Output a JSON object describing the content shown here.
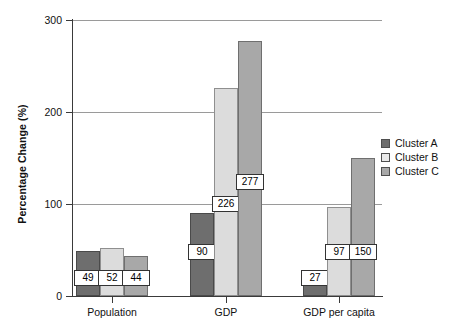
{
  "chart_data": {
    "type": "bar",
    "title": "",
    "xlabel": "",
    "ylabel": "Percentage Change (%)",
    "ylim": [
      0,
      300
    ],
    "yticks": [
      0,
      100,
      200,
      300
    ],
    "grid": true,
    "legend_position": "right",
    "categories": [
      "Population",
      "GDP",
      "GDP per capita"
    ],
    "series": [
      {
        "name": "Cluster A",
        "color": "#6e6e6e",
        "values": [
          49,
          90,
          27
        ]
      },
      {
        "name": "Cluster B",
        "color": "#dcdcdc",
        "values": [
          52,
          226,
          97
        ]
      },
      {
        "name": "Cluster C",
        "color": "#a8a8a8",
        "values": [
          44,
          277,
          150
        ]
      }
    ],
    "data_labels": [
      "49",
      "52",
      "44",
      "90",
      "226",
      "277",
      "27",
      "97",
      "150"
    ]
  },
  "axes": {
    "y_title": "Percentage Change (%)",
    "y_tick_labels": [
      "300",
      "200",
      "100",
      "0"
    ],
    "x_tick_labels": [
      "Population",
      "GDP",
      "GDP per capita"
    ]
  },
  "legend": {
    "items": [
      {
        "label": "Cluster A"
      },
      {
        "label": "Cluster B"
      },
      {
        "label": "Cluster C"
      }
    ]
  },
  "bars": [
    {
      "label": "49",
      "group": "Population",
      "series": "Cluster A"
    },
    {
      "label": "52",
      "group": "Population",
      "series": "Cluster B"
    },
    {
      "label": "44",
      "group": "Population",
      "series": "Cluster C"
    },
    {
      "label": "90",
      "group": "GDP",
      "series": "Cluster A"
    },
    {
      "label": "226",
      "group": "GDP",
      "series": "Cluster B"
    },
    {
      "label": "277",
      "group": "GDP",
      "series": "Cluster C"
    },
    {
      "label": "27",
      "group": "GDP per capita",
      "series": "Cluster A"
    },
    {
      "label": "97",
      "group": "GDP per capita",
      "series": "Cluster B"
    },
    {
      "label": "150",
      "group": "GDP per capita",
      "series": "Cluster C"
    }
  ]
}
